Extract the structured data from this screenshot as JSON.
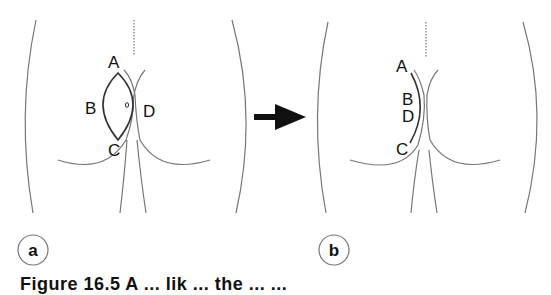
{
  "figure": {
    "panels": [
      {
        "id": "a",
        "label": "a",
        "title": "Before: lens-shaped excision marked over cleft",
        "points": {
          "A": "A",
          "B": "B",
          "C": "C",
          "D": "D"
        },
        "marker": "o"
      },
      {
        "id": "b",
        "label": "b",
        "title": "After: closure with B and D approximated off-midline",
        "points": {
          "A": "A",
          "B": "B",
          "D": "D",
          "C": "C"
        }
      }
    ],
    "arrow": "right-arrow",
    "caption": "Figure 16.5   A                    ...  lik ...  the ...  ..."
  },
  "colors": {
    "line": "#6e6e6e",
    "outline": "#333333",
    "text": "#111111",
    "background": "#ffffff"
  }
}
